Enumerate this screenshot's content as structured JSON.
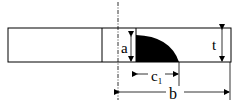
{
  "diagram": {
    "type": "crack-geometry",
    "labels": {
      "a": "a",
      "t": "t",
      "c": "c",
      "c_sub": "1",
      "b": "b"
    },
    "colors": {
      "stroke": "#000000",
      "crack_fill": "#000000",
      "background": "#ffffff"
    }
  }
}
